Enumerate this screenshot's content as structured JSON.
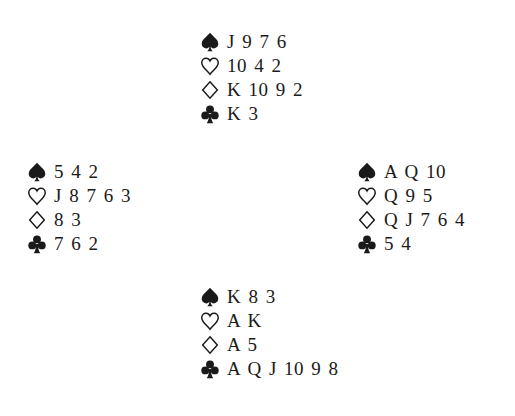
{
  "deal": {
    "north": {
      "spades": "J 9 7 6",
      "hearts": "10 4 2",
      "diamonds": "K 10 9 2",
      "clubs": "K 3"
    },
    "west": {
      "spades": "5 4 2",
      "hearts": "J 8 7 6 3",
      "diamonds": "8 3",
      "clubs": "7 6 2"
    },
    "east": {
      "spades": "A Q 10",
      "hearts": "Q 9 5",
      "diamonds": "Q J 7 6 4",
      "clubs": "5 4"
    },
    "south": {
      "spades": "K 8 3",
      "hearts": "A K",
      "diamonds": "A 5",
      "clubs": "A Q J 10 9 8"
    }
  },
  "icons": {
    "spades": "spade-icon",
    "hearts": "heart-icon",
    "diamonds": "diamond-icon",
    "clubs": "club-icon"
  },
  "colors": {
    "text": "#1a1a1a",
    "background": "#ffffff"
  }
}
